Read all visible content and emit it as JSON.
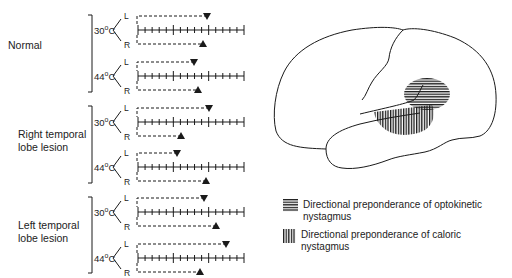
{
  "groups": [
    {
      "label_lines": [
        "Normal"
      ],
      "label_top": 40
    },
    {
      "label_lines": [
        "Right temporal",
        "lobe lesion"
      ],
      "label_top": 129
    },
    {
      "label_lines": [
        "Left temporal",
        "lobe lesion"
      ],
      "label_top": 220
    }
  ],
  "rows": [
    {
      "group": 0,
      "temp": "30",
      "unit": "C",
      "left_label": "L",
      "right_label": "R",
      "axis_y": 30,
      "L_marker_x": 207,
      "R_marker_x": 203
    },
    {
      "group": 0,
      "temp": "44",
      "unit": "C",
      "left_label": "L",
      "right_label": "R",
      "axis_y": 76,
      "L_marker_x": 194,
      "R_marker_x": 198
    },
    {
      "group": 1,
      "temp": "30",
      "unit": "C",
      "left_label": "L",
      "right_label": "R",
      "axis_y": 122,
      "L_marker_x": 209,
      "R_marker_x": 181
    },
    {
      "group": 1,
      "temp": "44",
      "unit": "C",
      "left_label": "L",
      "right_label": "R",
      "axis_y": 167,
      "L_marker_x": 177,
      "R_marker_x": 206
    },
    {
      "group": 2,
      "temp": "30",
      "unit": "C",
      "left_label": "L",
      "right_label": "R",
      "axis_y": 212,
      "L_marker_x": 204,
      "R_marker_x": 216
    },
    {
      "group": 2,
      "temp": "44",
      "unit": "C",
      "left_label": "L",
      "right_label": "R",
      "axis_y": 258,
      "L_marker_x": 226,
      "R_marker_x": 200
    }
  ],
  "labels": {
    "normal": "Normal",
    "right_line1": "Right temporal",
    "right_line2": "lobe lesion",
    "left_line1": "Left temporal",
    "left_line2": "lobe lesion",
    "t30": "30",
    "t44": "44",
    "deg": "o",
    "unit": "C",
    "L": "L",
    "R": "R"
  },
  "legend": {
    "optokinetic_text": "Directional preponderance of optokinetic nystagmus",
    "caloric_text": "Directional preponderance of caloric nystagmus",
    "optokinetic_icon": "horizontal-hatch-icon",
    "caloric_icon": "vertical-hatch-icon"
  },
  "colors": {
    "ink": "#1a1a1a",
    "background": "#ffffff"
  }
}
